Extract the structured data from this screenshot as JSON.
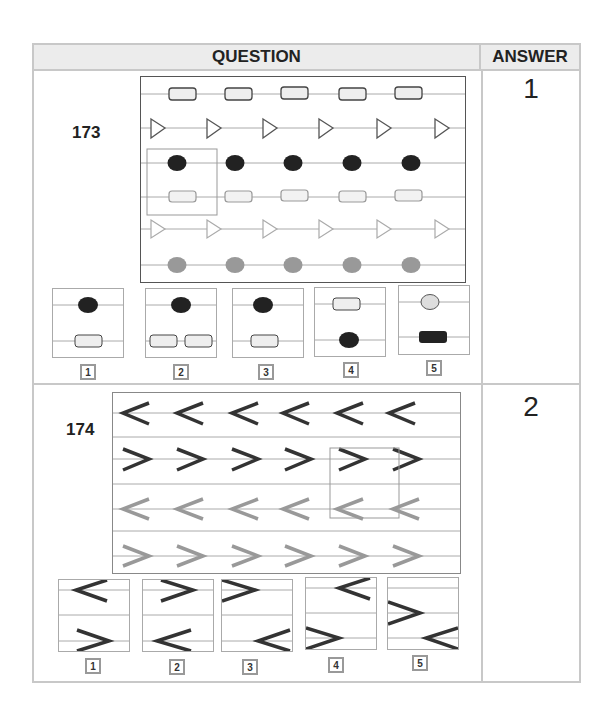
{
  "header": {
    "question": "QUESTION",
    "answer": "ANSWER"
  },
  "questions": [
    {
      "number": "173",
      "answer": "1",
      "grid_rows": [
        {
          "shape": "cylinder",
          "color": "light",
          "count": 5
        },
        {
          "shape": "triangle-right",
          "color": "dark-outline",
          "count": 6
        },
        {
          "shape": "ellipse",
          "color": "#222222",
          "count": 5
        },
        {
          "shape": "cylinder",
          "color": "light-gray-outline",
          "count": 5
        },
        {
          "shape": "triangle-right",
          "color": "gray-outline",
          "count": 6
        },
        {
          "shape": "ellipse",
          "color": "#999999",
          "count": 5
        }
      ],
      "options": [
        {
          "label": "1",
          "top": "dark-ellipse",
          "bottom": "cylinder"
        },
        {
          "label": "2",
          "top": "dark-ellipse",
          "bottom": "two-cylinders"
        },
        {
          "label": "3",
          "top": "dark-ellipse",
          "bottom": "cylinder"
        },
        {
          "label": "4",
          "top": "cylinder",
          "bottom": "dark-ellipse"
        },
        {
          "label": "5",
          "top": "light-ellipse",
          "bottom": "dark-cylinder"
        }
      ]
    },
    {
      "number": "174",
      "answer": "2",
      "grid_rows": [
        {
          "shape": "chevron-left",
          "color": "#333333",
          "count": 6
        },
        {
          "shape": "chevron-right",
          "color": "#333333",
          "count": 6
        },
        {
          "shape": "chevron-left",
          "color": "#999999",
          "count": 6
        },
        {
          "shape": "chevron-right",
          "color": "#999999",
          "count": 6
        }
      ],
      "options": [
        {
          "label": "1",
          "top": "chevron-left",
          "bottom": "chevron-right"
        },
        {
          "label": "2",
          "top": "chevron-right",
          "bottom": "chevron-left"
        },
        {
          "label": "3",
          "top": "chevron-right",
          "bottom": "chevron-left"
        },
        {
          "label": "4",
          "top": "chevron-left",
          "bottom": "chevron-right"
        },
        {
          "label": "5",
          "top": "chevron-right",
          "bottom": "chevron-left"
        }
      ]
    }
  ]
}
